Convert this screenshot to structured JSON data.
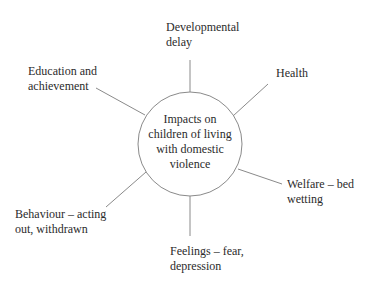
{
  "diagram": {
    "type": "spider / mind map",
    "center": {
      "lines": [
        "Impacts on",
        "children of living",
        "with domestic",
        "violence"
      ],
      "cx": 190,
      "cy": 144,
      "r": 52
    },
    "branches": [
      {
        "id": "developmental-delay",
        "lines": [
          "Developmental",
          "delay"
        ],
        "connector": {
          "x1": 190,
          "y1": 92,
          "x2": 190,
          "y2": 60
        }
      },
      {
        "id": "health",
        "lines": [
          "Health"
        ],
        "connector": {
          "x1": 233,
          "y1": 116,
          "x2": 268,
          "y2": 84
        }
      },
      {
        "id": "welfare",
        "lines": [
          "Welfare – bed",
          "wetting"
        ],
        "connector": {
          "x1": 238,
          "y1": 169,
          "x2": 282,
          "y2": 184
        }
      },
      {
        "id": "feelings",
        "lines": [
          "Feelings – fear,",
          "depression"
        ],
        "connector": {
          "x1": 190,
          "y1": 196,
          "x2": 190,
          "y2": 236
        }
      },
      {
        "id": "behaviour",
        "lines": [
          "Behaviour – acting",
          "out, withdrawn"
        ],
        "connector": {
          "x1": 146,
          "y1": 172,
          "x2": 106,
          "y2": 207
        }
      },
      {
        "id": "education",
        "lines": [
          "Education and",
          "achievement"
        ],
        "connector": {
          "x1": 145,
          "y1": 115,
          "x2": 96,
          "y2": 88
        }
      }
    ],
    "colors": {
      "line": "#8a8a8a",
      "text": "#2b2b2b",
      "background": "#ffffff"
    }
  }
}
